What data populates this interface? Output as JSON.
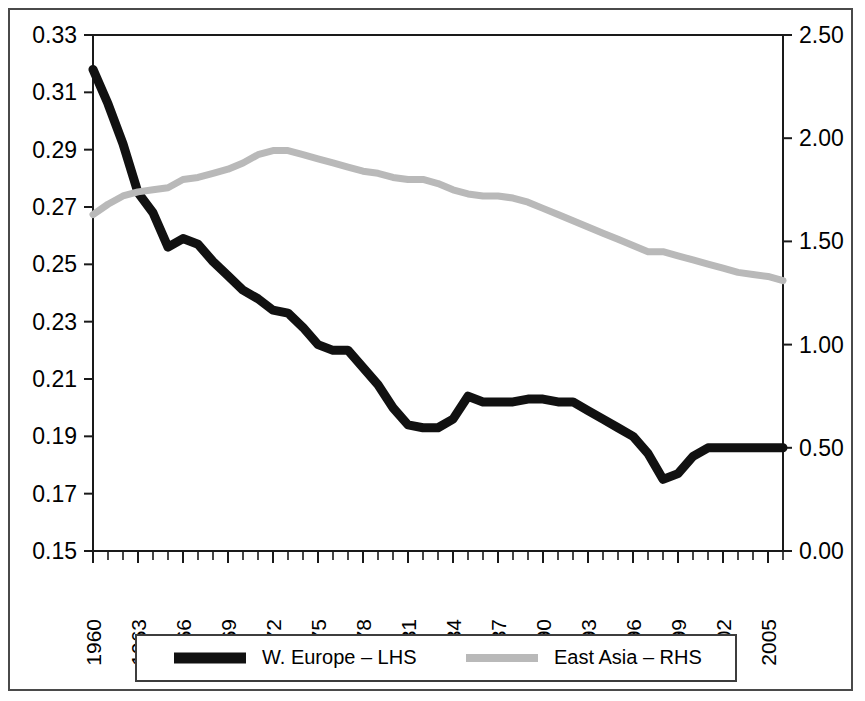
{
  "chart_data": {
    "type": "line",
    "title": "",
    "xlabel": "",
    "ylabel": "",
    "grid": false,
    "legend_position": "bottom",
    "x": [
      1960,
      1961,
      1962,
      1963,
      1964,
      1965,
      1966,
      1967,
      1968,
      1969,
      1970,
      1971,
      1972,
      1973,
      1974,
      1975,
      1976,
      1977,
      1978,
      1979,
      1980,
      1981,
      1982,
      1983,
      1984,
      1985,
      1986,
      1987,
      1988,
      1989,
      1990,
      1991,
      1992,
      1993,
      1994,
      1995,
      1996,
      1997,
      1998,
      1999,
      2000,
      2001,
      2002,
      2003,
      2004,
      2005,
      2006
    ],
    "x_tick_labels": [
      "1960",
      "1963",
      "1966",
      "1969",
      "1972",
      "1975",
      "1978",
      "1981",
      "1984",
      "1987",
      "1990",
      "1993",
      "1996",
      "1999",
      "2002",
      "2005"
    ],
    "x_tick_values": [
      1960,
      1963,
      1966,
      1969,
      1972,
      1975,
      1978,
      1981,
      1984,
      1987,
      1990,
      1993,
      1996,
      1999,
      2002,
      2005
    ],
    "xlim": [
      1960,
      2006
    ],
    "axes": [
      {
        "id": "lhs",
        "side": "left",
        "ylim": [
          0.15,
          0.33
        ],
        "tick_values": [
          0.15,
          0.17,
          0.19,
          0.21,
          0.23,
          0.25,
          0.27,
          0.29,
          0.31,
          0.33
        ],
        "tick_labels": [
          "0.15",
          "0.17",
          "0.19",
          "0.21",
          "0.23",
          "0.25",
          "0.27",
          "0.29",
          "0.31",
          "0.33"
        ]
      },
      {
        "id": "rhs",
        "side": "right",
        "ylim": [
          0.0,
          2.5
        ],
        "tick_values": [
          0.0,
          0.5,
          1.0,
          1.5,
          2.0,
          2.5
        ],
        "tick_labels": [
          "0.00",
          "0.50",
          "1.00",
          "1.50",
          "2.00",
          "2.50"
        ]
      }
    ],
    "series": [
      {
        "name": "W. Europe – LHS",
        "axis": "lhs",
        "color": "#111111",
        "values": [
          0.318,
          0.306,
          0.292,
          0.275,
          0.268,
          0.256,
          0.259,
          0.257,
          0.251,
          0.246,
          0.241,
          0.238,
          0.234,
          0.233,
          0.228,
          0.222,
          0.22,
          0.22,
          0.214,
          0.208,
          0.2,
          0.194,
          0.193,
          0.193,
          0.196,
          0.204,
          0.202,
          0.202,
          0.202,
          0.203,
          0.203,
          0.202,
          0.202,
          0.199,
          0.196,
          0.193,
          0.19,
          0.184,
          0.175,
          0.177,
          0.183,
          0.186,
          0.186,
          0.186,
          0.186,
          0.186,
          0.186
        ]
      },
      {
        "name": "East Asia – RHS",
        "axis": "rhs",
        "color": "#b9b9b9",
        "values": [
          1.63,
          1.68,
          1.72,
          1.74,
          1.75,
          1.76,
          1.8,
          1.81,
          1.83,
          1.85,
          1.88,
          1.92,
          1.94,
          1.94,
          1.92,
          1.9,
          1.88,
          1.86,
          1.84,
          1.83,
          1.81,
          1.8,
          1.8,
          1.78,
          1.75,
          1.73,
          1.72,
          1.72,
          1.71,
          1.69,
          1.66,
          1.63,
          1.6,
          1.57,
          1.54,
          1.51,
          1.48,
          1.45,
          1.45,
          1.43,
          1.41,
          1.39,
          1.37,
          1.35,
          1.34,
          1.33,
          1.31
        ]
      }
    ]
  },
  "legend": {
    "entries": [
      {
        "label": "W. Europe – LHS",
        "color": "#111111"
      },
      {
        "label": "East Asia – RHS",
        "color": "#b9b9b9"
      }
    ]
  }
}
